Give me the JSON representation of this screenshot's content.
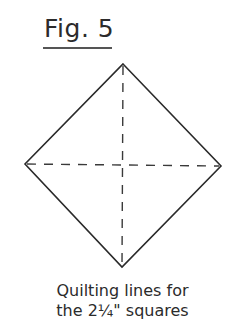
{
  "figure": {
    "title": "Fig. 5",
    "caption_line1": "Quilting lines for",
    "caption_line2": "the 2¼\" squares"
  },
  "diagram": {
    "shape": "square rotated 45° (diamond)",
    "vertices": {
      "top": [
        123,
        64
      ],
      "right": [
        221,
        166
      ],
      "bottom": [
        122,
        267
      ],
      "left": [
        25,
        164
      ]
    },
    "quilting_lines": [
      "vertical dashed diagonal",
      "horizontal dashed diagonal"
    ],
    "colors": {
      "outline": "#2a2a2a",
      "dashed": "#3a3a3a"
    }
  }
}
